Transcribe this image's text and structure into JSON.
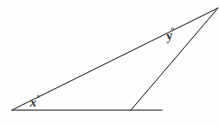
{
  "figure": {
    "kind": "geometry-angle-diagram",
    "background_color": "#fefefe",
    "stroke_color": "#4a4a4a",
    "label_color": "#2b2b2b",
    "labels": {
      "angle_x": "x",
      "angle_y": "y",
      "degree_symbol": "°"
    },
    "vertices": {
      "left_vertex": {
        "x": 12,
        "y": 110
      },
      "apex_vertex": {
        "x": 218,
        "y": 8
      },
      "baseline_right_end": {
        "x": 162,
        "y": 110
      },
      "inner_base_point": {
        "x": 131,
        "y": 110
      }
    },
    "segments": [
      {
        "name": "baseline",
        "x1": 12,
        "y1": 110,
        "x2": 162,
        "y2": 110
      },
      {
        "name": "long-diagonal",
        "x1": 12,
        "y1": 110,
        "x2": 218,
        "y2": 8
      },
      {
        "name": "inner-diagonal",
        "x1": 131,
        "y1": 110,
        "x2": 218,
        "y2": 8
      }
    ]
  }
}
